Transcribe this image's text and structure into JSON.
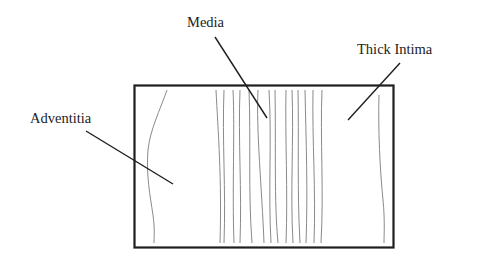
{
  "diagram": {
    "labels": {
      "media": "Media",
      "thick_intima": "Thick Intima",
      "adventitia": "Adventitia"
    },
    "colors": {
      "background": "#ffffff",
      "border": "#1e1e1e",
      "leader_line": "#1e1e1e",
      "fiber_line": "#8a8a8a",
      "text": "#222222"
    },
    "regions": [
      "Adventitia",
      "Media",
      "Thick Intima"
    ]
  }
}
